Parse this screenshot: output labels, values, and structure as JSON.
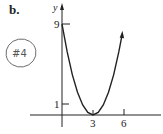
{
  "part_label": "b.",
  "annotation": "#4",
  "chart_data": {
    "type": "line",
    "title": "",
    "xlabel": "",
    "ylabel": "y",
    "function": "y = (x - 3)^2",
    "x": [
      0,
      0.5,
      1,
      1.5,
      2,
      2.5,
      3,
      3.5,
      4,
      4.5,
      5,
      5.5,
      5.8
    ],
    "series": [
      {
        "name": "parabola",
        "values": [
          9,
          6.25,
          4,
          2.25,
          1,
          0.25,
          0,
          0.25,
          1,
          2.25,
          4,
          6.25,
          7.84
        ]
      }
    ],
    "x_ticks": [
      {
        "value": 3,
        "label": "3"
      },
      {
        "value": 6,
        "label": "6"
      }
    ],
    "y_ticks": [
      {
        "value": 1,
        "label": "1"
      },
      {
        "value": 9,
        "label": "9"
      }
    ],
    "vertex": [
      3,
      0
    ],
    "y_intercept": 9,
    "grid": false,
    "legend": "none"
  }
}
